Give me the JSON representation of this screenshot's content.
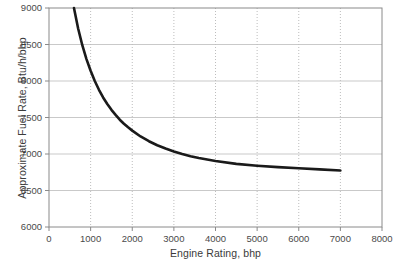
{
  "chart_data": {
    "type": "line",
    "title": "",
    "xlabel": "Engine Rating, bhp",
    "ylabel": "Approximate Fuel Rate, Btu/h/bhp",
    "xlim": [
      0,
      8000
    ],
    "ylim": [
      6000,
      9000
    ],
    "xticks": [
      0,
      1000,
      2000,
      3000,
      4000,
      5000,
      6000,
      7000,
      8000
    ],
    "yticks": [
      6000,
      6500,
      7000,
      7500,
      8000,
      8500,
      9000
    ],
    "xtick_labels": [
      "0",
      "1000",
      "2000",
      "3000",
      "4000",
      "5000",
      "6000",
      "7000",
      "8000"
    ],
    "ytick_labels": [
      "6000",
      "6500",
      "7000",
      "7500",
      "8000",
      "8500",
      "9000"
    ],
    "grid": true,
    "grid_x_style": "dotted",
    "grid_y_style": "solid",
    "legend": null,
    "series": [
      {
        "name": "Approximate Fuel Rate",
        "color": "#1a1a1a",
        "line_width": 2.6,
        "x": [
          600,
          700,
          800,
          900,
          1000,
          1100,
          1200,
          1300,
          1400,
          1500,
          1600,
          1700,
          1800,
          1900,
          2000,
          2200,
          2400,
          2600,
          2800,
          3000,
          3200,
          3400,
          3600,
          3800,
          4000,
          4500,
          5000,
          5500,
          6000,
          6500,
          7000
        ],
        "y": [
          9000,
          8720,
          8490,
          8300,
          8140,
          8000,
          7880,
          7775,
          7685,
          7605,
          7535,
          7470,
          7415,
          7365,
          7320,
          7240,
          7175,
          7120,
          7075,
          7035,
          7000,
          6970,
          6945,
          6925,
          6905,
          6865,
          6840,
          6820,
          6805,
          6790,
          6775
        ]
      }
    ]
  },
  "axes": {
    "x_title": "Engine Rating, bhp",
    "y_title": "Approximate Fuel Rate, Btu/h/bhp"
  },
  "colors": {
    "curve": "#1a1a1a",
    "grid": "#c9c9c9",
    "grid_dotted": "#bdbdbd",
    "border": "#8a8a8a",
    "tick_text": "#4a4a4a",
    "background": "#ffffff"
  }
}
